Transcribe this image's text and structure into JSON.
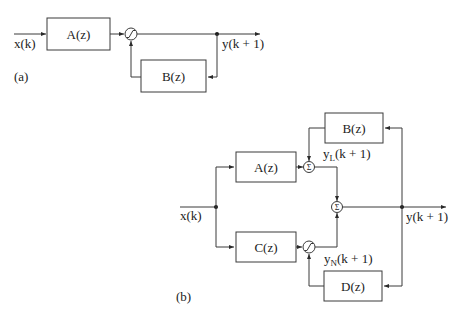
{
  "diagram_a": {
    "label": "(a)",
    "input_label": "x(k)",
    "output_label": "y(k + 1)",
    "blocks": [
      {
        "id": "A",
        "label": "A(z)"
      },
      {
        "id": "B",
        "label": "B(z)"
      }
    ],
    "nonlinear_symbol": "saturation-curve"
  },
  "diagram_b": {
    "label": "(b)",
    "input_label": "x(k)",
    "output_label": "y(k + 1)",
    "blocks": [
      {
        "id": "A",
        "label": "A(z)"
      },
      {
        "id": "B",
        "label": "B(z)"
      },
      {
        "id": "C",
        "label": "C(z)"
      },
      {
        "id": "D",
        "label": "D(z)"
      }
    ],
    "summing_symbol": "Σ",
    "linear_output": {
      "base": "y",
      "subscript": "L",
      "suffix": "(k + 1)"
    },
    "nonlinear_output": {
      "base": "y",
      "subscript": "N",
      "suffix": "(k + 1)"
    },
    "nonlinear_symbol": "saturation-curve"
  },
  "colors": {
    "line": "#3a3a3a",
    "text": "#222222",
    "background": "#ffffff"
  }
}
